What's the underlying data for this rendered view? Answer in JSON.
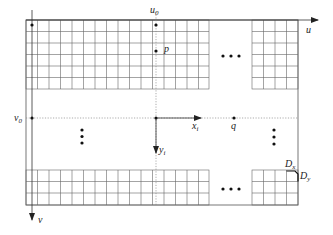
{
  "diagram": {
    "type": "image-grid-coordinate-diagram",
    "labels": {
      "u_axis": "u",
      "v_axis": "v",
      "u0": "u",
      "u0_sub": "0",
      "v0": "v",
      "v0_sub": "0",
      "p": "p",
      "q": "q",
      "xi": "x",
      "xi_sub": "i",
      "yi": "y",
      "yi_sub": "i",
      "Dx": "D",
      "Dx_sub": "x",
      "Dy": "D",
      "Dy_sub": "y"
    },
    "ellipsis": {
      "horizontal": "•••",
      "vertical": "⋮"
    },
    "grid": {
      "top_rows": 6,
      "bottom_rows": 3,
      "left_block_cols": 16,
      "right_block_cols": 4,
      "cell_size_px": 11.5
    },
    "colors": {
      "line": "#555555",
      "grid": "#666666",
      "text": "#222222"
    }
  }
}
